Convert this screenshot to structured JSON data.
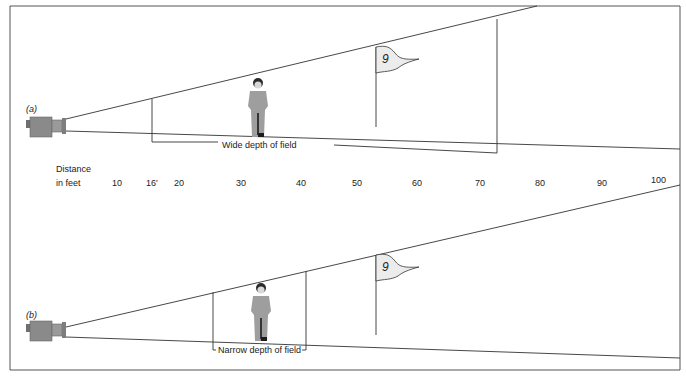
{
  "figure": {
    "frame": {
      "stroke": "#555555"
    },
    "colors": {
      "line": "#333333",
      "camera_body": "#8a8a8a",
      "camera_lens": "#9a9a9a",
      "person": "#9e9e9e",
      "person_hair": "#2a2a2a",
      "flag_fill": "#ececec"
    },
    "panel_a": {
      "tag": "(a)",
      "caption": "Wide depth of field",
      "flag_number": "9"
    },
    "panel_b": {
      "tag": "(b)",
      "caption": "Narrow depth of field",
      "flag_number": "9"
    },
    "distance_scale": {
      "label_line1": "Distance",
      "label_line2": "in feet",
      "ticks": [
        "10",
        "16'",
        "20",
        "30",
        "40",
        "50",
        "60",
        "70",
        "80",
        "90",
        "100"
      ]
    }
  }
}
